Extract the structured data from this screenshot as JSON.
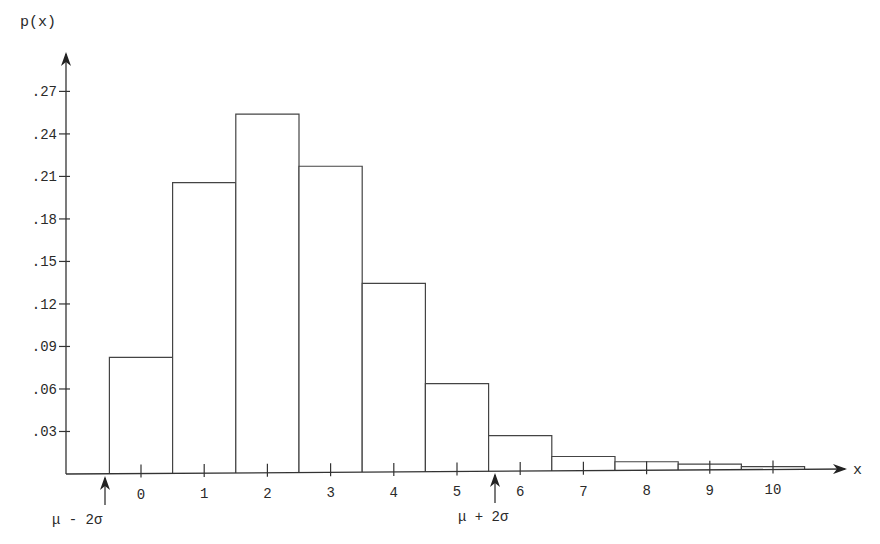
{
  "chart_data": {
    "type": "bar",
    "title": "",
    "xlabel": "x",
    "ylabel": "p(x)",
    "categories": [
      "0",
      "1",
      "2",
      "3",
      "4",
      "5",
      "6",
      "7",
      "8",
      "9",
      "10"
    ],
    "values": [
      0.082,
      0.205,
      0.253,
      0.216,
      0.133,
      0.062,
      0.025,
      0.01,
      0.006,
      0.004,
      0.002
    ],
    "yticks": [
      ".03",
      ".06",
      ".09",
      ".12",
      ".15",
      ".18",
      ".21",
      ".24",
      ".27"
    ],
    "ytick_values": [
      0.03,
      0.06,
      0.09,
      0.12,
      0.15,
      0.18,
      0.21,
      0.24,
      0.27
    ],
    "ylim": [
      0,
      0.29
    ],
    "xlim": [
      -0.5,
      10.5
    ],
    "grid": false,
    "legend": null,
    "annotations": [
      {
        "label": "μ - 2σ",
        "x": -0.5,
        "type": "up-arrow"
      },
      {
        "label": "μ + 2σ",
        "x": 5.5,
        "type": "up-arrow"
      }
    ]
  },
  "axes": {
    "y_label": "p(x)",
    "x_label": "x"
  },
  "annotations": {
    "lower": "μ - 2σ",
    "upper": "μ + 2σ"
  }
}
